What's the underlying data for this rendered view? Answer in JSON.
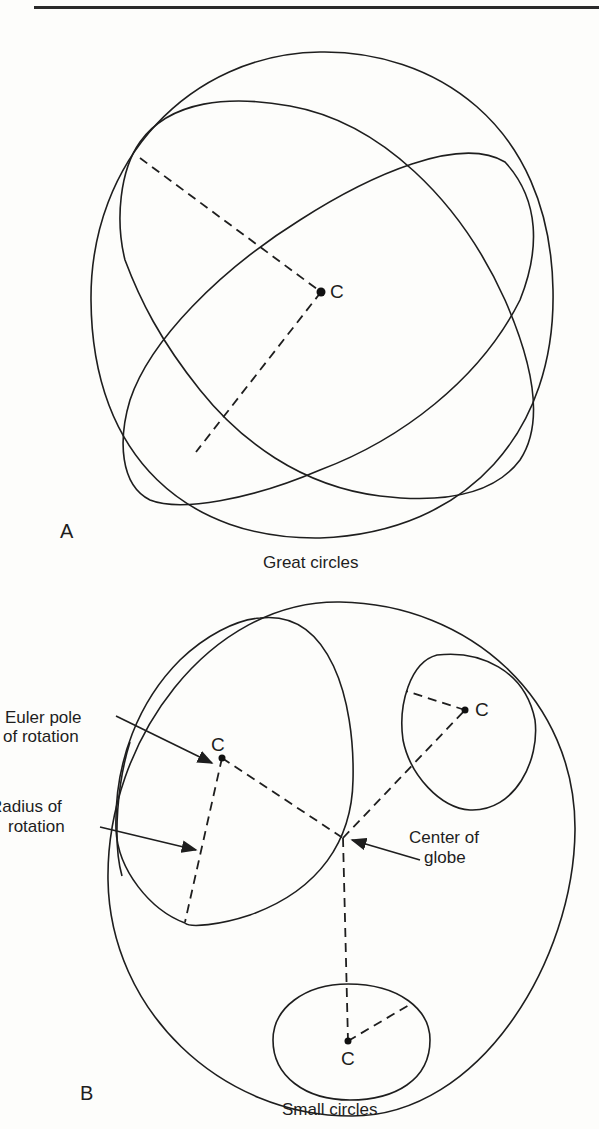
{
  "figure": {
    "panel_a": {
      "letter": "A",
      "caption": "Great circles",
      "center_label": "C"
    },
    "panel_b": {
      "letter": "B",
      "caption": "Small circles",
      "pole_labels": [
        "C",
        "C",
        "C"
      ],
      "annotations": {
        "euler_pole_line1": "Euler pole",
        "euler_pole_line2": "of rotation",
        "radius_line1": "Radius  of",
        "radius_line2": "rotation",
        "center_line1": "Center of",
        "center_line2": "globe"
      }
    }
  }
}
